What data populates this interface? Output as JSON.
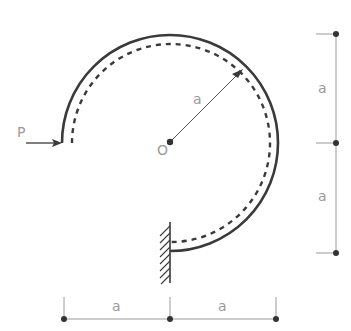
{
  "diagram": {
    "type": "curved-beam-mechanics",
    "labels": {
      "force": "P",
      "center": "O",
      "radius": "a",
      "dim_right_top": "a",
      "dim_right_bottom": "a",
      "dim_bottom_left": "a",
      "dim_bottom_right": "a"
    },
    "colors": {
      "beam": "#3a3a3a",
      "dimension_line": "#9a9a9a",
      "label": "#9a9a9a",
      "point": "#333333"
    },
    "geometry": {
      "center": [
        170,
        142
      ],
      "beam_radius": 108,
      "centerline_radius": 100,
      "support": "fixed-wall"
    }
  }
}
